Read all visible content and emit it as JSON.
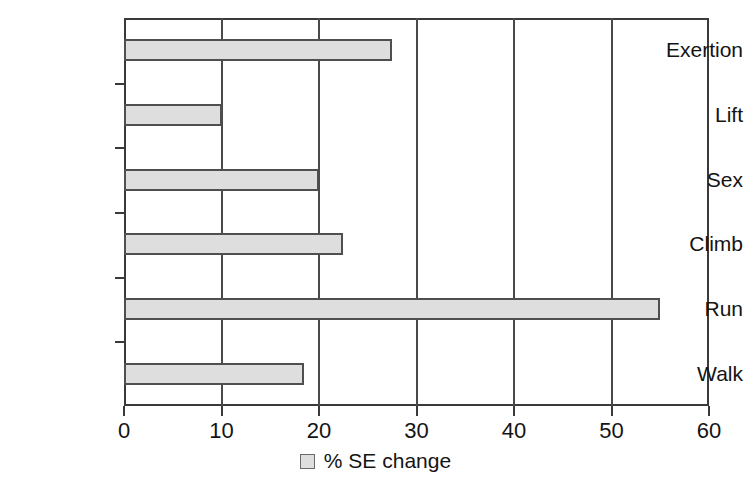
{
  "chart_data": {
    "type": "bar",
    "orientation": "horizontal",
    "title": "",
    "xlabel": "",
    "ylabel": "",
    "categories": [
      "Exertion",
      "Lift",
      "Sex",
      "Climb",
      "Run",
      "Walk"
    ],
    "values": [
      27.5,
      10,
      20,
      22.5,
      55,
      18.5
    ],
    "series": [
      {
        "name": "% SE change",
        "values": [
          27.5,
          10,
          20,
          22.5,
          55,
          18.5
        ]
      }
    ],
    "xlim": [
      0,
      60
    ],
    "xticks": [
      0,
      10,
      20,
      30,
      40,
      50,
      60
    ],
    "xtick_labels": [
      "0",
      "10",
      "20",
      "30",
      "40",
      "50",
      "60"
    ],
    "grid": "vertical",
    "legend": {
      "position": "bottom-center",
      "entries": [
        {
          "label": "% SE change",
          "swatch_color": "#dedede"
        }
      ]
    },
    "colors": {
      "bar_fill": "#dedede",
      "bar_border": "#4f4f4f",
      "axis": "#3a3a3a",
      "gridline": "#4a4a4a",
      "text": "#141414",
      "background": "#ffffff"
    }
  }
}
